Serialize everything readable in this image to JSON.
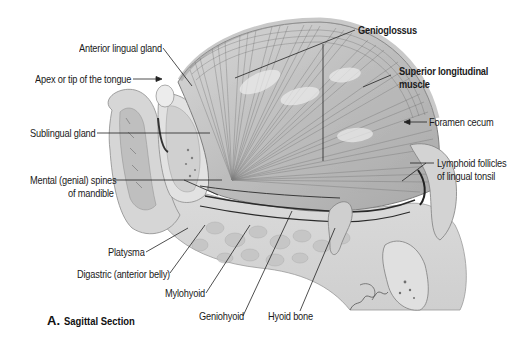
{
  "figure": {
    "caption_letter": "A.",
    "caption_text": "Sagittal Section"
  },
  "labels": {
    "anterior_lingual_gland": "Anterior lingual gland",
    "apex_of_tongue": "Apex or tip of the tongue",
    "sublingual_gland": "Sublingual gland",
    "mental_spines_line1": "Mental (genial) spines",
    "mental_spines_line2": "of mandible",
    "platysma": "Platysma",
    "digastric": "Digastric (anterior belly)",
    "mylohyoid": "Mylohyoid",
    "geniohyoid": "Geniohyoid",
    "hyoid_bone": "Hyoid bone",
    "genioglossus": "Genioglossus",
    "superior_longitudinal_line1": "Superior longitudinal",
    "superior_longitudinal_line2": "muscle",
    "foramen_cecum": "Foramen cecum",
    "lymphoid_line1": "Lymphoid follicles",
    "lymphoid_line2": "of lingual tonsil"
  },
  "colors": {
    "background": "#ffffff",
    "label_text": "#1a1a1a",
    "leader_line": "#222222",
    "tissue_light": "#e4e4e4",
    "tissue_mid": "#c8c8c8",
    "tissue_dark": "#8a8a8a",
    "muscle_fiber": "#6e6e6e"
  }
}
